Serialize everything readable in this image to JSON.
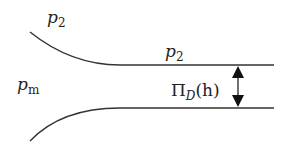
{
  "diagram": {
    "labels": {
      "p2_top_left": {
        "base": "p",
        "sub": "2"
      },
      "p2_film": {
        "base": "p",
        "sub": "2"
      },
      "pm": {
        "base": "p",
        "sub": "m"
      },
      "disjoining": {
        "pi": "Π",
        "sub": "D",
        "arg": "(h)"
      }
    },
    "colors": {
      "stroke": "#333333",
      "background": "#ffffff"
    }
  }
}
